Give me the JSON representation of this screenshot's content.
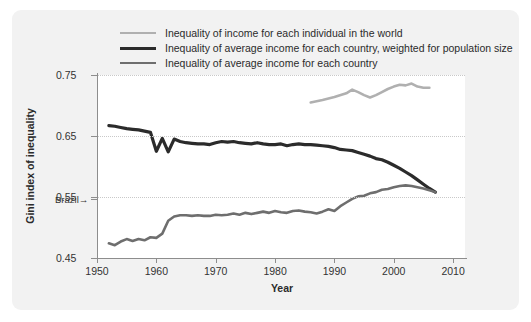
{
  "figure": {
    "background": "#f2f2f2",
    "plot_background": "#ffffff"
  },
  "legend": {
    "position": "top-left",
    "items": [
      {
        "label": "Inequality of income for each individual in the world",
        "color": "#b0b0b0",
        "width": 2.6
      },
      {
        "label": "Inequality of average income for each country, weighted for population size",
        "color": "#2b2b2b",
        "width": 3.2
      },
      {
        "label": "Inequality of average income for each country",
        "color": "#6e6e6e",
        "width": 2.6
      }
    ]
  },
  "annotations": [
    {
      "name": "brazil-marker",
      "text": "Brazil→",
      "value": 0.546
    }
  ],
  "chart_data": {
    "type": "line",
    "title": "",
    "xlabel": "Year",
    "ylabel": "Gini index of inequality",
    "xlim": [
      1950,
      2012
    ],
    "ylim": [
      0.45,
      0.75
    ],
    "xticks": [
      1950,
      1960,
      1970,
      1980,
      1990,
      2000,
      2010
    ],
    "yticks": [
      0.45,
      0.55,
      0.65,
      0.75
    ],
    "ytick_labels": [
      "0.45",
      "0.55",
      "0.65",
      "0.75"
    ],
    "grid": "horizontal-dotted",
    "series": [
      {
        "name": "Inequality of income for each individual in the world",
        "color": "#b0b0b0",
        "x": [
          1986,
          1988,
          1990,
          1992,
          1993,
          1994,
          1995,
          1996,
          1997,
          1998,
          1999,
          2000,
          2001,
          2002,
          2003,
          2004,
          2005,
          2006
        ],
        "y": [
          0.705,
          0.709,
          0.714,
          0.72,
          0.726,
          0.722,
          0.717,
          0.713,
          0.717,
          0.722,
          0.727,
          0.731,
          0.734,
          0.733,
          0.736,
          0.731,
          0.729,
          0.729
        ]
      },
      {
        "name": "Inequality of average income for each country, weighted for population size",
        "color": "#2b2b2b",
        "x": [
          1952,
          1953,
          1954,
          1955,
          1956,
          1957,
          1958,
          1959,
          1960,
          1961,
          1962,
          1963,
          1964,
          1965,
          1966,
          1967,
          1968,
          1969,
          1970,
          1971,
          1972,
          1973,
          1974,
          1975,
          1976,
          1977,
          1978,
          1979,
          1980,
          1981,
          1982,
          1983,
          1984,
          1985,
          1986,
          1987,
          1988,
          1989,
          1990,
          1991,
          1992,
          1993,
          1994,
          1995,
          1996,
          1997,
          1998,
          1999,
          2000,
          2001,
          2002,
          2003,
          2004,
          2005,
          2006,
          2007
        ],
        "y": [
          0.667,
          0.666,
          0.664,
          0.662,
          0.661,
          0.66,
          0.658,
          0.656,
          0.625,
          0.646,
          0.624,
          0.645,
          0.641,
          0.639,
          0.638,
          0.637,
          0.637,
          0.636,
          0.639,
          0.641,
          0.64,
          0.641,
          0.639,
          0.638,
          0.637,
          0.639,
          0.637,
          0.636,
          0.636,
          0.637,
          0.634,
          0.636,
          0.637,
          0.636,
          0.636,
          0.635,
          0.634,
          0.633,
          0.631,
          0.628,
          0.627,
          0.626,
          0.623,
          0.62,
          0.617,
          0.613,
          0.611,
          0.607,
          0.602,
          0.597,
          0.591,
          0.585,
          0.578,
          0.571,
          0.564,
          0.558
        ]
      },
      {
        "name": "Inequality of average income for each country",
        "color": "#6e6e6e",
        "x": [
          1952,
          1953,
          1954,
          1955,
          1956,
          1957,
          1958,
          1959,
          1960,
          1961,
          1962,
          1963,
          1964,
          1965,
          1966,
          1967,
          1968,
          1969,
          1970,
          1971,
          1972,
          1973,
          1974,
          1975,
          1976,
          1977,
          1978,
          1979,
          1980,
          1981,
          1982,
          1983,
          1984,
          1985,
          1986,
          1987,
          1988,
          1989,
          1990,
          1991,
          1992,
          1993,
          1994,
          1995,
          1996,
          1997,
          1998,
          1999,
          2000,
          2001,
          2002,
          2003,
          2004,
          2005,
          2006,
          2007
        ],
        "y": [
          0.474,
          0.471,
          0.477,
          0.481,
          0.478,
          0.481,
          0.479,
          0.484,
          0.483,
          0.49,
          0.511,
          0.518,
          0.52,
          0.52,
          0.519,
          0.52,
          0.519,
          0.519,
          0.521,
          0.52,
          0.521,
          0.523,
          0.521,
          0.524,
          0.522,
          0.524,
          0.526,
          0.524,
          0.527,
          0.525,
          0.524,
          0.527,
          0.528,
          0.526,
          0.525,
          0.523,
          0.526,
          0.53,
          0.527,
          0.535,
          0.541,
          0.547,
          0.551,
          0.552,
          0.556,
          0.558,
          0.562,
          0.563,
          0.566,
          0.568,
          0.569,
          0.568,
          0.566,
          0.564,
          0.561,
          0.558
        ]
      }
    ]
  }
}
